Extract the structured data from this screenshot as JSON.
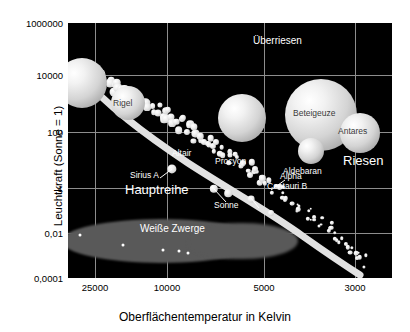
{
  "chart_data": {
    "type": "scatter",
    "xlabel": "Oberflächentemperatur in Kelvin",
    "ylabel": "Leuchtkraft (Sonne = 1)",
    "x_scale": "log-reversed",
    "y_scale": "log",
    "xticks": [
      "25000",
      "10000",
      "5000",
      "3000"
    ],
    "xtick_values": [
      25000,
      10000,
      5000,
      3000
    ],
    "yticks": [
      "1000000",
      "10000",
      "100",
      "1",
      "0,01",
      "0,0001"
    ],
    "ytick_values": [
      1000000,
      10000,
      100,
      1,
      0.01,
      0.0001
    ],
    "ylim": [
      0.0001,
      1000000
    ],
    "xlim": [
      40000,
      2500
    ],
    "grid": true,
    "legend_position": "none",
    "regions": [
      {
        "name": "Überriesen",
        "label": "Überriesen"
      },
      {
        "name": "Riesen",
        "label": "Riesen"
      },
      {
        "name": "Hauptreihe",
        "label": "Hauptreihe"
      },
      {
        "name": "Weiße Zwerge",
        "label": "Weiße Zwerge"
      }
    ],
    "named_stars": [
      {
        "label": "Rigel",
        "temperature": 12000,
        "luminosity": 60000
      },
      {
        "label": "Beteigeuze",
        "temperature": 3500,
        "luminosity": 50000
      },
      {
        "label": "Antares",
        "temperature": 3400,
        "luminosity": 10000
      },
      {
        "label": "Aldebaran",
        "temperature": 3900,
        "luminosity": 400
      },
      {
        "label": "Sirius A",
        "temperature": 9900,
        "luminosity": 25
      },
      {
        "label": "Altair",
        "temperature": 7700,
        "luminosity": 10
      },
      {
        "label": "Procyon",
        "temperature": 6500,
        "luminosity": 7
      },
      {
        "label": "Sonne",
        "temperature": 5800,
        "luminosity": 1
      },
      {
        "label": "Alpha Centauri B",
        "temperature": 5200,
        "luminosity": 0.5
      }
    ],
    "series": [
      {
        "name": "Hauptreihe (Main sequence)",
        "point_count": 130
      },
      {
        "name": "Weiße Zwerge (White dwarfs)",
        "point_count": 5
      },
      {
        "name": "Überriesen / Riesen",
        "point_count": 6
      }
    ]
  },
  "axes": {
    "x_title": "Oberflächentemperatur in Kelvin",
    "y_title": "Leuchtkraft (Sonne = 1)",
    "x_ticks": [
      {
        "label": "25000",
        "pos": 27
      },
      {
        "label": "10000",
        "pos": 99
      },
      {
        "label": "5000",
        "pos": 196
      },
      {
        "label": "3000",
        "pos": 287
      }
    ],
    "y_ticks": [
      {
        "label": "1000000",
        "pos": 0
      },
      {
        "label": "10000",
        "pos": 52
      },
      {
        "label": "100",
        "pos": 109
      },
      {
        "label": "1",
        "pos": 165
      },
      {
        "label": "0,01",
        "pos": 210
      },
      {
        "label": "0,0001",
        "pos": 255
      }
    ]
  },
  "labels": {
    "ueberriesen": "Überriesen",
    "riesen": "Riesen",
    "hauptreihe": "Hauptreihe",
    "weisse_zwerge": "Weiße Zwerge",
    "rigel": "Rigel",
    "beteigeuze": "Beteigeuze",
    "antares": "Antares",
    "aldebaran": "Aldebaran",
    "sirius_a": "Sirius A",
    "altair": "Altair",
    "procyon": "Procyon",
    "sonne": "Sonne",
    "alpha": "Alpha",
    "centauri_b": "Centauri B"
  },
  "colors": {
    "plot_background": "#000000",
    "grid": "#8d8d8d",
    "star_fill": "#e8e8e8",
    "dwarf_region": "#595959",
    "text_on_plot": "#ffffff",
    "page_background": "#ffffff",
    "axis_text": "#000000"
  },
  "geometry": {
    "supergiants": [
      {
        "name": "blue-supergiant",
        "cx": 14,
        "cy": 60,
        "r": 25
      },
      {
        "name": "rigel-star",
        "cx": 60,
        "cy": 80,
        "r": 17
      },
      {
        "name": "yellow-supergiant",
        "cx": 174,
        "cy": 95,
        "r": 24
      },
      {
        "name": "beteigeuze-star",
        "cx": 253,
        "cy": 92,
        "r": 36
      },
      {
        "name": "antares-star",
        "cx": 292,
        "cy": 110,
        "r": 20
      },
      {
        "name": "aldebaran-star",
        "cx": 243,
        "cy": 128,
        "r": 13
      }
    ],
    "dwarf_dots": [
      {
        "cx": 12,
        "cy": 212
      },
      {
        "cx": 55,
        "cy": 222
      },
      {
        "cx": 95,
        "cy": 227
      },
      {
        "cx": 111,
        "cy": 228
      },
      {
        "cx": 120,
        "cy": 230
      }
    ]
  }
}
